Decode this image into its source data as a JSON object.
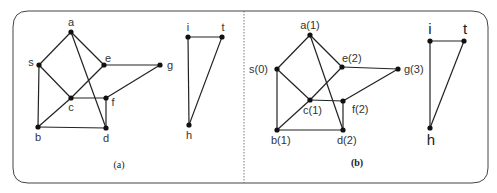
{
  "figure": {
    "panels": [
      {
        "id": "a",
        "caption": "(a)",
        "nodes": [
          {
            "id": "a",
            "label": "a",
            "x": 71,
            "y": 32,
            "lx": 71,
            "ly": 26,
            "anchor": "middle"
          },
          {
            "id": "s",
            "label": "s",
            "x": 39,
            "y": 65,
            "lx": 31,
            "ly": 66,
            "anchor": "middle"
          },
          {
            "id": "e",
            "label": "e",
            "x": 104,
            "y": 65,
            "lx": 108,
            "ly": 62,
            "anchor": "middle"
          },
          {
            "id": "g",
            "label": "g",
            "x": 160,
            "y": 65,
            "lx": 170,
            "ly": 69,
            "anchor": "middle"
          },
          {
            "id": "c",
            "label": "c",
            "x": 71,
            "y": 98,
            "lx": 71,
            "ly": 111,
            "anchor": "middle"
          },
          {
            "id": "f",
            "label": "f",
            "x": 106,
            "y": 98,
            "lx": 113,
            "ly": 106,
            "anchor": "middle"
          },
          {
            "id": "b",
            "label": "b",
            "x": 38,
            "y": 127,
            "lx": 38,
            "ly": 141,
            "anchor": "middle"
          },
          {
            "id": "d",
            "label": "d",
            "x": 106,
            "y": 128,
            "lx": 106,
            "ly": 142,
            "anchor": "middle"
          },
          {
            "id": "i",
            "label": "i",
            "x": 188,
            "y": 37,
            "lx": 188,
            "ly": 31,
            "anchor": "middle"
          },
          {
            "id": "t",
            "label": "t",
            "x": 222,
            "y": 37,
            "lx": 223,
            "ly": 31,
            "anchor": "middle"
          },
          {
            "id": "h",
            "label": "h",
            "x": 189,
            "y": 125,
            "lx": 189,
            "ly": 139,
            "anchor": "middle"
          }
        ],
        "edges": [
          [
            "a",
            "s"
          ],
          [
            "a",
            "e"
          ],
          [
            "a",
            "d"
          ],
          [
            "s",
            "c"
          ],
          [
            "s",
            "b"
          ],
          [
            "e",
            "c"
          ],
          [
            "e",
            "g"
          ],
          [
            "c",
            "b"
          ],
          [
            "c",
            "f"
          ],
          [
            "f",
            "g"
          ],
          [
            "f",
            "d"
          ],
          [
            "b",
            "d"
          ],
          [
            "i",
            "t"
          ],
          [
            "i",
            "h"
          ],
          [
            "t",
            "h"
          ]
        ],
        "caption_x": 119,
        "caption_y": 168
      },
      {
        "id": "b",
        "caption": "(b)",
        "nodes": [
          {
            "id": "a",
            "label": "a(1)",
            "x": 310,
            "y": 35,
            "lx": 310,
            "ly": 29,
            "anchor": "middle"
          },
          {
            "id": "s",
            "label": "s(0)",
            "x": 277,
            "y": 69,
            "lx": 268,
            "ly": 73,
            "anchor": "end"
          },
          {
            "id": "e",
            "label": "e(2)",
            "x": 342,
            "y": 67,
            "lx": 342,
            "ly": 62,
            "anchor": "start"
          },
          {
            "id": "g",
            "label": "g(3)",
            "x": 398,
            "y": 69,
            "lx": 404,
            "ly": 73,
            "anchor": "start"
          },
          {
            "id": "c",
            "label": "c(1)",
            "x": 310,
            "y": 100,
            "lx": 303,
            "ly": 114,
            "anchor": "start"
          },
          {
            "id": "f",
            "label": "f(2)",
            "x": 343,
            "y": 101,
            "lx": 352,
            "ly": 113,
            "anchor": "start"
          },
          {
            "id": "b",
            "label": "b(1)",
            "x": 277,
            "y": 130,
            "lx": 271,
            "ly": 144,
            "anchor": "start"
          },
          {
            "id": "d",
            "label": "d(2)",
            "x": 343,
            "y": 130,
            "lx": 337,
            "ly": 144,
            "anchor": "start"
          },
          {
            "id": "i",
            "label": "i",
            "x": 430,
            "y": 41,
            "lx": 430,
            "ly": 34,
            "anchor": "middle",
            "big": true
          },
          {
            "id": "t",
            "label": "t",
            "x": 464,
            "y": 41,
            "lx": 465,
            "ly": 34,
            "anchor": "middle",
            "big": true
          },
          {
            "id": "h",
            "label": "h",
            "x": 430,
            "y": 128,
            "lx": 431,
            "ly": 145,
            "anchor": "middle",
            "big": true
          }
        ],
        "edges": [
          [
            "a",
            "s"
          ],
          [
            "a",
            "e"
          ],
          [
            "a",
            "d"
          ],
          [
            "s",
            "c"
          ],
          [
            "s",
            "b"
          ],
          [
            "e",
            "c"
          ],
          [
            "e",
            "g"
          ],
          [
            "c",
            "b"
          ],
          [
            "c",
            "f"
          ],
          [
            "f",
            "g"
          ],
          [
            "f",
            "d"
          ],
          [
            "b",
            "d"
          ],
          [
            "i",
            "t"
          ],
          [
            "i",
            "h"
          ],
          [
            "t",
            "h"
          ]
        ],
        "caption_x": 357,
        "caption_y": 166
      }
    ],
    "colors": {
      "edge": "#222222",
      "node": "#111111",
      "frame": "#444444",
      "divider": "#555555"
    }
  }
}
